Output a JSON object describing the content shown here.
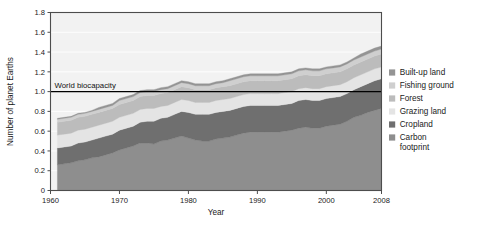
{
  "chart_data": {
    "type": "area",
    "stacked": true,
    "title": "",
    "xlabel": "Year",
    "ylabel": "Number of planet Earths",
    "xlim": [
      1960,
      2008
    ],
    "ylim": [
      0,
      1.8
    ],
    "grid": true,
    "grid_axis": "y",
    "legend_position": "right",
    "xticks": [
      1960,
      1970,
      1980,
      1990,
      2000,
      2008
    ],
    "xtick_labels": [
      "1960",
      "1970",
      "1980",
      "1990",
      "2000",
      "2008"
    ],
    "yticks": [
      0,
      0.2,
      0.4,
      0.6,
      0.8,
      1.0,
      1.2,
      1.4,
      1.6,
      1.8
    ],
    "ytick_labels": [
      "0",
      "0.2",
      "0.4",
      "0.6",
      "0.8",
      "1.0",
      "1.2",
      "1.4",
      "1.6",
      "1.8"
    ],
    "annotations": [
      {
        "name": "world-biocapacity-line",
        "label": "World biocapacity",
        "y": 1.0,
        "color": "#000000"
      }
    ],
    "x": [
      1961,
      1962,
      1963,
      1964,
      1965,
      1966,
      1967,
      1968,
      1969,
      1970,
      1971,
      1972,
      1973,
      1974,
      1975,
      1976,
      1977,
      1978,
      1979,
      1980,
      1981,
      1982,
      1983,
      1984,
      1985,
      1986,
      1987,
      1988,
      1989,
      1990,
      1991,
      1992,
      1993,
      1994,
      1995,
      1996,
      1997,
      1998,
      1999,
      2000,
      2001,
      2002,
      2003,
      2004,
      2005,
      2006,
      2007,
      2008
    ],
    "series": [
      {
        "name": "Carbon footprint",
        "color": "#8e8e8e",
        "values": [
          0.26,
          0.27,
          0.28,
          0.3,
          0.31,
          0.33,
          0.34,
          0.36,
          0.38,
          0.41,
          0.43,
          0.45,
          0.48,
          0.48,
          0.47,
          0.5,
          0.51,
          0.53,
          0.55,
          0.53,
          0.51,
          0.5,
          0.5,
          0.52,
          0.53,
          0.54,
          0.56,
          0.58,
          0.59,
          0.59,
          0.59,
          0.59,
          0.59,
          0.6,
          0.61,
          0.63,
          0.64,
          0.63,
          0.63,
          0.65,
          0.66,
          0.67,
          0.7,
          0.74,
          0.76,
          0.79,
          0.81,
          0.83
        ]
      },
      {
        "name": "Cropland",
        "color": "#6f6f6f",
        "values": [
          0.17,
          0.17,
          0.17,
          0.18,
          0.18,
          0.18,
          0.19,
          0.19,
          0.19,
          0.2,
          0.2,
          0.2,
          0.21,
          0.22,
          0.23,
          0.23,
          0.23,
          0.24,
          0.25,
          0.26,
          0.26,
          0.27,
          0.27,
          0.27,
          0.27,
          0.27,
          0.27,
          0.27,
          0.27,
          0.27,
          0.27,
          0.27,
          0.27,
          0.27,
          0.27,
          0.28,
          0.28,
          0.28,
          0.28,
          0.28,
          0.28,
          0.28,
          0.28,
          0.28,
          0.29,
          0.29,
          0.3,
          0.3
        ]
      },
      {
        "name": "Grazing land",
        "color": "#e4e4e4",
        "values": [
          0.13,
          0.13,
          0.13,
          0.13,
          0.13,
          0.13,
          0.13,
          0.13,
          0.13,
          0.13,
          0.13,
          0.13,
          0.13,
          0.13,
          0.13,
          0.12,
          0.12,
          0.12,
          0.12,
          0.12,
          0.12,
          0.12,
          0.12,
          0.12,
          0.12,
          0.12,
          0.12,
          0.12,
          0.12,
          0.12,
          0.12,
          0.12,
          0.12,
          0.12,
          0.12,
          0.12,
          0.12,
          0.12,
          0.12,
          0.12,
          0.12,
          0.12,
          0.12,
          0.12,
          0.12,
          0.12,
          0.12,
          0.12
        ]
      },
      {
        "name": "Forest",
        "color": "#bcbcbc",
        "values": [
          0.13,
          0.13,
          0.13,
          0.13,
          0.13,
          0.13,
          0.13,
          0.13,
          0.13,
          0.13,
          0.13,
          0.13,
          0.13,
          0.13,
          0.13,
          0.13,
          0.13,
          0.13,
          0.13,
          0.13,
          0.13,
          0.13,
          0.13,
          0.13,
          0.13,
          0.13,
          0.13,
          0.13,
          0.13,
          0.13,
          0.13,
          0.13,
          0.13,
          0.13,
          0.13,
          0.13,
          0.13,
          0.13,
          0.13,
          0.13,
          0.13,
          0.13,
          0.13,
          0.13,
          0.13,
          0.13,
          0.13,
          0.13
        ]
      },
      {
        "name": "Fishing ground",
        "color": "#cfcfcf",
        "values": [
          0.03,
          0.03,
          0.03,
          0.03,
          0.03,
          0.03,
          0.03,
          0.03,
          0.03,
          0.04,
          0.04,
          0.04,
          0.04,
          0.04,
          0.04,
          0.04,
          0.04,
          0.04,
          0.04,
          0.04,
          0.04,
          0.04,
          0.04,
          0.04,
          0.04,
          0.05,
          0.05,
          0.05,
          0.05,
          0.05,
          0.05,
          0.05,
          0.05,
          0.05,
          0.05,
          0.05,
          0.05,
          0.05,
          0.05,
          0.05,
          0.05,
          0.05,
          0.05,
          0.05,
          0.05,
          0.05,
          0.05,
          0.05
        ]
      },
      {
        "name": "Built-up land",
        "color": "#949494",
        "values": [
          0.01,
          0.01,
          0.01,
          0.01,
          0.01,
          0.01,
          0.02,
          0.02,
          0.02,
          0.02,
          0.02,
          0.02,
          0.02,
          0.02,
          0.02,
          0.02,
          0.02,
          0.02,
          0.02,
          0.02,
          0.02,
          0.02,
          0.02,
          0.02,
          0.02,
          0.02,
          0.02,
          0.02,
          0.02,
          0.02,
          0.02,
          0.02,
          0.02,
          0.02,
          0.02,
          0.02,
          0.02,
          0.02,
          0.02,
          0.02,
          0.02,
          0.02,
          0.02,
          0.02,
          0.03,
          0.03,
          0.03,
          0.03
        ]
      }
    ],
    "legend_entries": [
      {
        "label": "Built-up land",
        "color": "#949494"
      },
      {
        "label": "Fishing ground",
        "color": "#cfcfcf"
      },
      {
        "label": "Forest",
        "color": "#bcbcbc"
      },
      {
        "label": "Grazing land",
        "color": "#e4e4e4"
      },
      {
        "label": "Cropland",
        "color": "#6f6f6f"
      },
      {
        "label": "Carbon footprint",
        "color": "#8e8e8e"
      }
    ]
  },
  "style": {
    "plot_background": "#f2f2f2",
    "frame_color": "#4d4d4d",
    "grid_color": "#ffffff",
    "page_background": "#ffffff"
  }
}
